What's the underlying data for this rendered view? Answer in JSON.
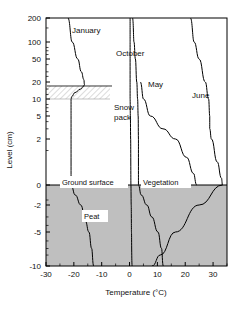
{
  "chart_data": {
    "type": "line",
    "title": "",
    "xlabel": "Temperature (°C)",
    "ylabel": "Level (cm)",
    "xlim": [
      -30,
      35
    ],
    "ylim_labels": [
      "200",
      "100",
      "50",
      "20",
      "10",
      "5",
      "2",
      "0",
      "-2",
      "-5",
      "-10"
    ],
    "x_ticks": [
      -30,
      -20,
      -10,
      0,
      10,
      20,
      30
    ],
    "x_tick_labels": [
      "-30",
      "-20",
      "-10",
      "0",
      "10",
      "20",
      "30"
    ],
    "y_ticks": [
      200,
      100,
      50,
      20,
      10,
      5,
      2,
      0,
      -2,
      -5,
      -10
    ],
    "y_tick_labels": [
      "200",
      "100",
      "50",
      "20",
      "10",
      "5",
      "2",
      "0",
      "-2",
      "-5",
      "-10"
    ],
    "grid": false,
    "legend": "inline-curve-labels",
    "axis_note": "y axis is symmetric-log in level (cm); 0 = ground surface",
    "series": [
      {
        "name": "January",
        "label": "January",
        "points": [
          {
            "level": 200,
            "temp": -22.0
          },
          {
            "level": 100,
            "temp": -20.6
          },
          {
            "level": 50,
            "temp": -18.6
          },
          {
            "level": 30,
            "temp": -17.3
          },
          {
            "level": 22,
            "temp": -16.4
          },
          {
            "level": 18,
            "temp": -16.2
          },
          {
            "level": 17,
            "temp": -16.4
          },
          {
            "level": 15,
            "temp": -17.6
          },
          {
            "level": 13,
            "temp": -19.6
          },
          {
            "level": 11,
            "temp": -20.8
          },
          {
            "level": 10,
            "temp": -21.0
          },
          {
            "level": 5,
            "temp": -21.0
          },
          {
            "level": 2,
            "temp": -21.0
          },
          {
            "level": 0,
            "temp": -21.0
          },
          {
            "level": -1,
            "temp": -19.5
          },
          {
            "level": -2,
            "temp": -17.5
          },
          {
            "level": -3.5,
            "temp": -15.8
          },
          {
            "level": -5,
            "temp": -14.6
          },
          {
            "level": -7,
            "temp": -13.6
          },
          {
            "level": -10,
            "temp": -13.0
          }
        ]
      },
      {
        "name": "October",
        "label": "October",
        "points": [
          {
            "level": 200,
            "temp": 0.2
          },
          {
            "level": 100,
            "temp": 0.2
          },
          {
            "level": 50,
            "temp": 0.2
          },
          {
            "level": 20,
            "temp": 0.2
          },
          {
            "level": 10,
            "temp": 0.2
          },
          {
            "level": 5,
            "temp": 0.3
          },
          {
            "level": 2,
            "temp": 0.4
          },
          {
            "level": 0,
            "temp": 0.5
          },
          {
            "level": -2,
            "temp": 0.6
          },
          {
            "level": -5,
            "temp": 0.7
          },
          {
            "level": -10,
            "temp": 0.8
          }
        ]
      },
      {
        "name": "May",
        "label": "May",
        "points": [
          {
            "level": 200,
            "temp": 1.2
          },
          {
            "level": 100,
            "temp": 1.6
          },
          {
            "level": 50,
            "temp": 2.1
          },
          {
            "level": 20,
            "temp": 2.6
          },
          {
            "level": 10,
            "temp": 2.9
          },
          {
            "level": 5,
            "temp": 3.1
          },
          {
            "level": 2,
            "temp": 3.2
          },
          {
            "level": 0,
            "temp": 3.2
          },
          {
            "level": -1,
            "temp": 4.2
          },
          {
            "level": -2,
            "temp": 6.2
          },
          {
            "level": -3,
            "temp": 8.0
          },
          {
            "level": -5,
            "temp": 10.2
          },
          {
            "level": -7,
            "temp": 11.5
          },
          {
            "level": -10,
            "temp": 12.0
          }
        ]
      },
      {
        "name": "May-vegetation",
        "label": "",
        "points": [
          {
            "level": 20,
            "temp": 4.0
          },
          {
            "level": 10,
            "temp": 5.0
          },
          {
            "level": 5,
            "temp": 7.5
          },
          {
            "level": 3,
            "temp": 12.0
          },
          {
            "level": 2,
            "temp": 16.5
          },
          {
            "level": 1.2,
            "temp": 20.5
          },
          {
            "level": 0.5,
            "temp": 23.0
          },
          {
            "level": 0,
            "temp": 24.0
          }
        ]
      },
      {
        "name": "June",
        "label": "June",
        "points": [
          {
            "level": 200,
            "temp": 22.0
          },
          {
            "level": 100,
            "temp": 23.2
          },
          {
            "level": 50,
            "temp": 25.0
          },
          {
            "level": 20,
            "temp": 27.2
          },
          {
            "level": 10,
            "temp": 28.4
          },
          {
            "level": 5,
            "temp": 28.8
          },
          {
            "level": 3,
            "temp": 28.8
          },
          {
            "level": 2,
            "temp": 29.4
          },
          {
            "level": 1,
            "temp": 31.5
          },
          {
            "level": 0.3,
            "temp": 33.0
          },
          {
            "level": 0,
            "temp": 33.4
          },
          {
            "level": -2,
            "temp": 25.0
          },
          {
            "level": -5,
            "temp": 16.5
          },
          {
            "level": -8,
            "temp": 11.0
          },
          {
            "level": -10,
            "temp": 8.2
          }
        ]
      }
    ],
    "annotations": [
      {
        "name": "snow-pack",
        "label": "Snow\npack",
        "line1": "Snow",
        "line2": "pack",
        "region_top_level": 17,
        "region_bottom_level": 10,
        "style": "hatched"
      },
      {
        "name": "ground-surface",
        "label": "Ground surface",
        "level": 0
      },
      {
        "name": "vegetation",
        "label": "Vegetation",
        "level": 1
      },
      {
        "name": "peat",
        "label": "Peat",
        "level": -2,
        "style": "shaded-gray"
      }
    ]
  },
  "labels": {
    "january": "January",
    "october": "October",
    "may": "May",
    "june": "June",
    "snow_line1": "Snow",
    "snow_line2": "pack",
    "ground_surface": "Ground surface",
    "vegetation": "Vegetation",
    "peat": "Peat",
    "xlabel": "Temperature (°C)",
    "ylabel": "Level (cm)"
  },
  "ticks": {
    "y": [
      "200",
      "100",
      "50",
      "20",
      "10",
      "5",
      "2",
      "0",
      "-2",
      "-5",
      "-10"
    ],
    "x": [
      "-30",
      "-20",
      "-10",
      "0",
      "10",
      "20",
      "30"
    ]
  },
  "colors": {
    "peat_fill": "#bfbfbf",
    "line": "#000000",
    "axis": "#000000",
    "background": "#ffffff"
  }
}
